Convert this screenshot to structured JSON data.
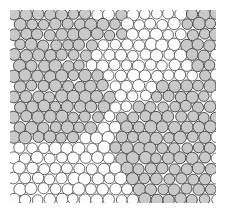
{
  "figure": {
    "width": 230,
    "height": 217,
    "background_color": "#ffffff"
  },
  "plot_area": {
    "x": 10,
    "y": 10,
    "width": 206,
    "height": 193,
    "frame_color": "#e8e8e8"
  },
  "chart_data": {
    "type": "scatter",
    "subtitle": "",
    "xlabel": "",
    "ylabel": "",
    "xlim": [
      0,
      206
    ],
    "ylim": [
      0,
      193
    ],
    "grid": false,
    "legend_position": "none",
    "marker": "circle",
    "marker_diameter_px": 11.6,
    "lattice": {
      "type": "hexagonal-close-packed",
      "column_spacing_px": 11.9,
      "row_spacing_px": 10.3,
      "row_offset_px": 5.95,
      "columns": 18,
      "rows": 19,
      "position_jitter_px": 0.9,
      "radius_jitter_px": 0.55
    },
    "categories": [
      "ordered-domain",
      "disordered-domain"
    ],
    "series": [
      {
        "name": "ordered-domain",
        "fill": "#c9c9c9",
        "stroke": "#4f4f4f",
        "stroke_width": 1.0,
        "count_fraction": 0.57,
        "description": "Grey discs marking hexagonally ordered crystalline grains"
      },
      {
        "name": "disordered-domain",
        "fill": "#fdfdfd",
        "stroke": "#6a6a6a",
        "stroke_width": 1.0,
        "count_fraction": 0.43,
        "description": "White discs marking disordered grain-boundary regions"
      }
    ],
    "domain_regions": [
      {
        "label": "grain-A-upper-left",
        "series": "ordered-domain",
        "polygon": [
          [
            0,
            0
          ],
          [
            82,
            0
          ],
          [
            88,
            26
          ],
          [
            74,
            52
          ],
          [
            96,
            72
          ],
          [
            104,
            96
          ],
          [
            88,
            118
          ],
          [
            60,
            132
          ],
          [
            22,
            134
          ],
          [
            0,
            126
          ]
        ]
      },
      {
        "label": "grain-B-upper-right-corner",
        "series": "ordered-domain",
        "polygon": [
          [
            176,
            0
          ],
          [
            206,
            0
          ],
          [
            206,
            74
          ],
          [
            186,
            66
          ],
          [
            170,
            38
          ]
        ]
      },
      {
        "label": "grain-C-lower-right",
        "series": "ordered-domain",
        "polygon": [
          [
            112,
            104
          ],
          [
            150,
            76
          ],
          [
            206,
            70
          ],
          [
            206,
            193
          ],
          [
            128,
            193
          ],
          [
            108,
            164
          ],
          [
            104,
            128
          ]
        ]
      },
      {
        "label": "grain-D-small-upper-middle",
        "series": "ordered-domain",
        "polygon": [
          [
            90,
            8
          ],
          [
            112,
            4
          ],
          [
            116,
            22
          ],
          [
            100,
            34
          ],
          [
            86,
            26
          ]
        ]
      },
      {
        "label": "boundary-upper-right",
        "series": "disordered-domain",
        "polygon": [
          [
            88,
            0
          ],
          [
            176,
            0
          ],
          [
            172,
            40
          ],
          [
            188,
            68
          ],
          [
            150,
            76
          ],
          [
            112,
            104
          ],
          [
            96,
            72
          ],
          [
            74,
            52
          ]
        ]
      },
      {
        "label": "boundary-lower-left",
        "series": "disordered-domain",
        "polygon": [
          [
            0,
            126
          ],
          [
            22,
            134
          ],
          [
            60,
            132
          ],
          [
            88,
            118
          ],
          [
            104,
            128
          ],
          [
            108,
            164
          ],
          [
            128,
            193
          ],
          [
            0,
            193
          ]
        ]
      }
    ]
  }
}
